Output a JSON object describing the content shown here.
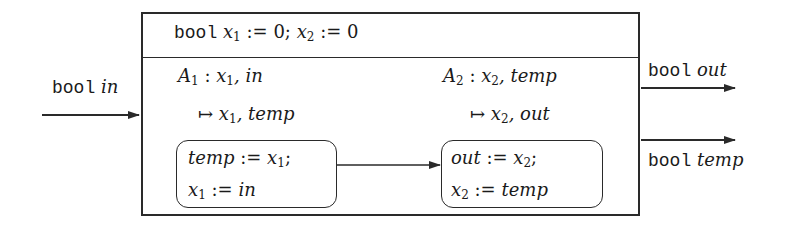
{
  "diagram": {
    "type": "component-block",
    "declaration": {
      "keyword": "bool",
      "vars": [
        {
          "name": "x",
          "sub": "1",
          "init": "0"
        },
        {
          "name": "x",
          "sub": "2",
          "init": "0"
        }
      ],
      "assign_op": ":=",
      "separator": ";"
    },
    "input": {
      "type": "bool",
      "name": "in"
    },
    "outputs": [
      {
        "type": "bool",
        "name": "out"
      },
      {
        "type": "bool",
        "name": "temp"
      }
    ],
    "tasks": [
      {
        "label": "A",
        "label_sub": "1",
        "reads": [
          "x₁",
          "in"
        ],
        "reads_text_a": "x",
        "reads_sub": "1",
        "reads_text_b": ", in",
        "maps_to": "↦",
        "writes_text_a": "x",
        "writes_sub": "1",
        "writes_text_b": ", temp",
        "body": [
          {
            "lhs": "temp",
            "op": ":=",
            "rhs": "x",
            "rhs_sub": "1",
            "end": ";"
          },
          {
            "lhs": "x",
            "lhs_sub": "1",
            "op": ":=",
            "rhs": "in",
            "end": ""
          }
        ]
      },
      {
        "label": "A",
        "label_sub": "2",
        "reads_text_a": "x",
        "reads_sub": "2",
        "reads_text_b": ", temp",
        "maps_to": "↦",
        "writes_text_a": "x",
        "writes_sub": "2",
        "writes_text_b": ", out",
        "body": [
          {
            "lhs": "out",
            "op": ":=",
            "rhs": "x",
            "rhs_sub": "2",
            "end": ";"
          },
          {
            "lhs": "x",
            "lhs_sub": "2",
            "op": ":=",
            "rhs": "temp",
            "end": ""
          }
        ]
      }
    ],
    "edges": [
      {
        "from": "input:in",
        "to": "block"
      },
      {
        "from": "task:A1",
        "to": "task:A2"
      },
      {
        "from": "block",
        "to": "output:out"
      },
      {
        "from": "block",
        "to": "output:temp"
      }
    ],
    "colors": {
      "stroke": "#2a2a2a",
      "text": "#1a1a1a",
      "background": "#ffffff"
    }
  }
}
